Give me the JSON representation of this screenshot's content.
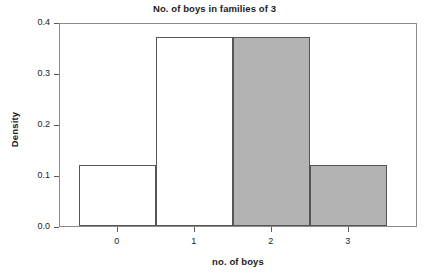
{
  "chart_data": {
    "type": "bar",
    "title": "No. of boys in families of 3",
    "xlabel": "no. of boys",
    "ylabel": "Density",
    "categories": [
      "0",
      "1",
      "2",
      "3"
    ],
    "values": [
      0.12,
      0.37,
      0.37,
      0.12
    ],
    "bin_edges": [
      -0.5,
      0.5,
      1.5,
      2.5,
      3.5
    ],
    "bar_fill_colors": [
      "#ffffff",
      "#ffffff",
      "#b3b3b3",
      "#b3b3b3"
    ],
    "bar_edge_color": "#555555",
    "xlim": [
      -0.75,
      3.9
    ],
    "ylim": [
      0.0,
      0.4
    ],
    "yticks": [
      0.0,
      0.1,
      0.2,
      0.3,
      0.4
    ],
    "ytick_labels": [
      "0.0",
      "0.1",
      "0.2",
      "0.3",
      "0.4"
    ],
    "xticks": [
      0,
      1,
      2,
      3
    ],
    "xtick_labels": [
      "0",
      "1",
      "2",
      "3"
    ],
    "grid": false,
    "legend": null,
    "frame": true
  }
}
